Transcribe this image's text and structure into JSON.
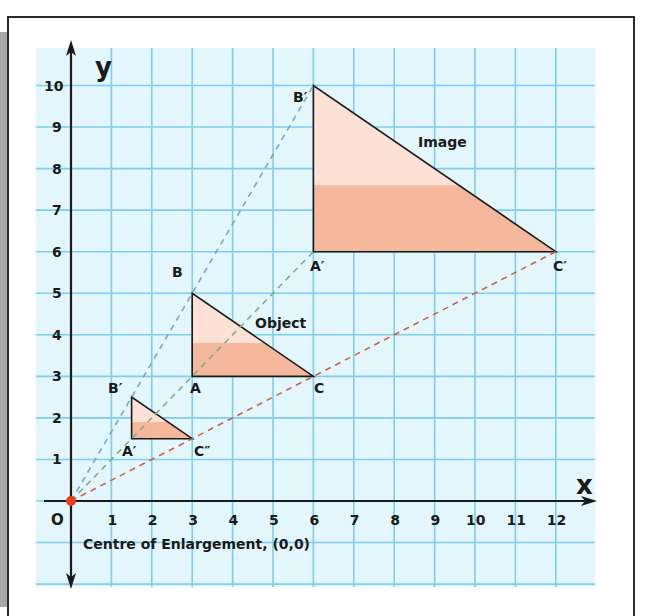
{
  "axes": {
    "x_label": "x",
    "y_label": "y",
    "origin_label": "O",
    "x_ticks": [
      "1",
      "2",
      "3",
      "4",
      "5",
      "6",
      "7",
      "8",
      "9",
      "10",
      "11",
      "12"
    ],
    "y_ticks": [
      "1",
      "2",
      "3",
      "4",
      "5",
      "6",
      "7",
      "8",
      "9",
      "10"
    ]
  },
  "shapes": {
    "object": {
      "label": "Object",
      "vertices": {
        "A": [
          3,
          3
        ],
        "B": [
          3,
          5
        ],
        "C": [
          6,
          3
        ]
      },
      "vertex_labels": {
        "A": "A",
        "B": "B",
        "C": "C"
      }
    },
    "image_large": {
      "label": "Image",
      "scale_factor": 2,
      "vertices": {
        "A": [
          6,
          6
        ],
        "B": [
          6,
          10
        ],
        "C": [
          12,
          6
        ]
      },
      "vertex_labels": {
        "A": "A′",
        "B": "B′",
        "C": "C′"
      }
    },
    "image_small": {
      "scale_factor": 0.5,
      "vertices": {
        "A": [
          1.5,
          1.5
        ],
        "B": [
          1.5,
          2.5
        ],
        "C": [
          3,
          1.5
        ]
      },
      "vertex_labels": {
        "A": "A′",
        "B": "B′",
        "C": "C″"
      }
    }
  },
  "centre": {
    "caption": "Centre of Enlargement, (0,0)",
    "point": [
      0,
      0
    ]
  },
  "colors": {
    "grid_bg": "#e3f6fc",
    "grid_line": "#7fcdea",
    "triangle_fill": "#fde0d6",
    "triangle_band": "#f6b89c",
    "ray_blue": "#7ea6c6",
    "ray_green": "#7fae86",
    "ray_red": "#c8634a",
    "centre_dot": "#e8401e"
  },
  "chart_data": {
    "type": "scatter",
    "xlabel": "x",
    "ylabel": "y",
    "xlim": [
      -0.7,
      12.9
    ],
    "ylim": [
      -2.1,
      11.0
    ],
    "grid": true,
    "series": [
      {
        "name": "Object ABC",
        "points": [
          [
            3,
            3
          ],
          [
            3,
            5
          ],
          [
            6,
            3
          ]
        ]
      },
      {
        "name": "Image A'B'C' (scale factor 2)",
        "points": [
          [
            6,
            6
          ],
          [
            6,
            10
          ],
          [
            12,
            6
          ]
        ]
      },
      {
        "name": "Image A'B'C'' (scale factor 1/2)",
        "points": [
          [
            1.5,
            1.5
          ],
          [
            1.5,
            2.5
          ],
          [
            3,
            1.5
          ]
        ]
      },
      {
        "name": "Centre of Enlargement",
        "points": [
          [
            0,
            0
          ]
        ]
      }
    ],
    "rays": [
      {
        "from": [
          0,
          0
        ],
        "to": [
          6,
          10
        ],
        "color": "blue",
        "style": "dashed"
      },
      {
        "from": [
          0,
          0
        ],
        "to": [
          6,
          6
        ],
        "color": "green",
        "style": "dashed"
      },
      {
        "from": [
          0,
          0
        ],
        "to": [
          12,
          6
        ],
        "color": "red",
        "style": "dashed"
      }
    ],
    "annotations": [
      "Object",
      "Image",
      "Centre of Enlargement, (0,0)"
    ]
  }
}
